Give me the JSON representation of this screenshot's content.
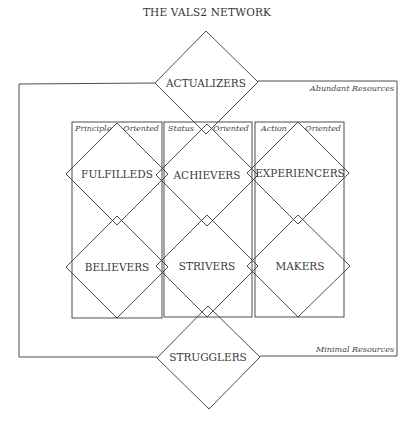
{
  "title": "THE VALS2 NETWORK",
  "resources": {
    "top_label": "Abundant Resources",
    "bottom_label": "Minimal Resources"
  },
  "orientations": [
    {
      "left": "Principle",
      "right": "Oriented"
    },
    {
      "left": "Status",
      "right": "Oriented"
    },
    {
      "left": "Action",
      "right": "Oriented"
    }
  ],
  "segments": {
    "top": "ACTUALIZERS",
    "row1": [
      "FULFILLEDS",
      "ACHIEVERS",
      "EXPERIENCERS"
    ],
    "row2": [
      "BELIEVERS",
      "STRIVERS",
      "MAKERS"
    ],
    "bottom": "STRUGGLERS"
  },
  "colors": {
    "line": "#3b3b3b",
    "text": "#3a3a3a",
    "background": "#ffffff"
  }
}
